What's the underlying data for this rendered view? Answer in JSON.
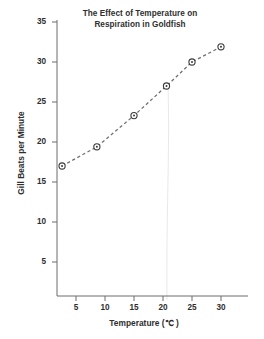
{
  "chart_data": {
    "type": "line",
    "title": "The Effect of Temperature on Respiration in Goldfish",
    "title_line1": "The Effect of Temperature on",
    "title_line2": "Respiration in Goldfish",
    "xlabel": "Temperature (℃ )",
    "ylabel": "Gill Beats per Minute",
    "x": [
      2.6,
      8.6,
      15.0,
      20.6,
      25.0,
      30.0
    ],
    "values": [
      17.0,
      19.4,
      23.3,
      27.0,
      30.0,
      31.9
    ],
    "series": [
      {
        "name": "Gill beats per minute",
        "x": [
          2.6,
          8.6,
          15.0,
          20.6,
          25.0,
          30.0
        ],
        "values": [
          17.0,
          19.4,
          23.3,
          27.0,
          30.0,
          31.9
        ]
      }
    ],
    "xlim": [
      0,
      32.5
    ],
    "ylim": [
      0,
      36
    ],
    "xticks": [
      5,
      10,
      15,
      20,
      25,
      30
    ],
    "yticks": [
      5,
      10,
      15,
      20,
      25,
      30,
      35
    ],
    "xtick_labels": [
      "5",
      "10",
      "15",
      "20",
      "25",
      "30"
    ],
    "ytick_labels": [
      "5",
      "10",
      "15",
      "20",
      "25",
      "30",
      "35"
    ],
    "grid": false,
    "legend": null,
    "legend_position": "none",
    "line_style": "dashed",
    "marker": "circle-with-center-dot",
    "annotations": []
  },
  "colors": {
    "background": "#ffffff",
    "axis": "#6d6d6d",
    "text": "#2e2e2e",
    "line": "#6f6f6f",
    "marker_fill": "#ffffff",
    "marker_edge": "#3a3a3a",
    "artifact_line": "#dcdcdc"
  }
}
